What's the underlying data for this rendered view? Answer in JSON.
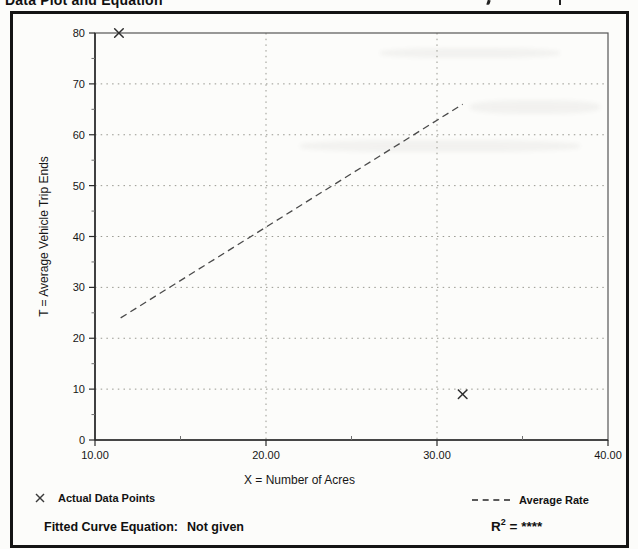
{
  "page": {
    "title": "Data Plot and Equation"
  },
  "chart_data": {
    "type": "scatter",
    "title": "Data Plot and Equation",
    "xlabel": "X = Number of Acres",
    "ylabel": "T = Average Vehicle Trip Ends",
    "xlim": [
      10,
      40
    ],
    "ylim": [
      0,
      80
    ],
    "x_tick_values": [
      10,
      20,
      30,
      40
    ],
    "x_tick_labels": [
      "10.00",
      "20.00",
      "30.00",
      "40.00"
    ],
    "x_minor_ticks": [
      15,
      25,
      35
    ],
    "y_tick_values": [
      0,
      10,
      20,
      30,
      40,
      50,
      60,
      70,
      80
    ],
    "y_tick_labels": [
      "0",
      "10",
      "20",
      "30",
      "40",
      "50",
      "60",
      "70",
      "80"
    ],
    "y_minor_ticks": [
      5,
      15,
      25,
      35,
      45,
      55,
      65,
      75
    ],
    "grid_x": [
      20,
      30
    ],
    "grid_y": [
      10,
      20,
      30,
      40,
      50,
      60,
      70
    ],
    "grid_style": "dotted",
    "marker": "x",
    "points": [
      {
        "x": 11.4,
        "t": 80
      },
      {
        "x": 31.5,
        "t": 9
      }
    ],
    "series": [
      {
        "name": "Average Rate",
        "style": "dashed",
        "x": [
          11.5,
          31.5
        ],
        "t": [
          24,
          66
        ]
      }
    ],
    "legend_position": "below"
  },
  "legend": {
    "data_points_label": "Actual Data Points",
    "average_rate_label": "Average Rate"
  },
  "footer": {
    "fitted_curve_label": "Fitted Curve Equation:",
    "fitted_curve_value": "Not given",
    "r2": {
      "base": "R",
      "exp": "2",
      "rest": " = ****"
    }
  },
  "colors": {
    "ink": "#141414",
    "axis": "#2b2b2b",
    "grid": "#989890",
    "paper": "#fcfcfa"
  }
}
